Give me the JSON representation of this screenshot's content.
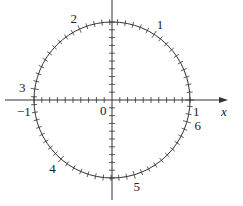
{
  "diagram": {
    "axes": {
      "x_label": "x",
      "y_label": "y",
      "origin_label": "0",
      "x_neg_one_label": "−1",
      "x_pos_one_label": "1",
      "tick_step": 0.1
    },
    "circle": {
      "radius": 1,
      "tick_step_radians": 0.1,
      "radian_labels": [
        {
          "value": 1,
          "text": "1"
        },
        {
          "value": 2,
          "text": "2"
        },
        {
          "value": 3,
          "text": "3"
        },
        {
          "value": 4,
          "text": "4"
        },
        {
          "value": 5,
          "text": "5"
        },
        {
          "value": 6,
          "text": "6"
        }
      ]
    },
    "colors": {
      "stroke": "#333333",
      "text": "#222222",
      "background": "#ffffff"
    }
  }
}
